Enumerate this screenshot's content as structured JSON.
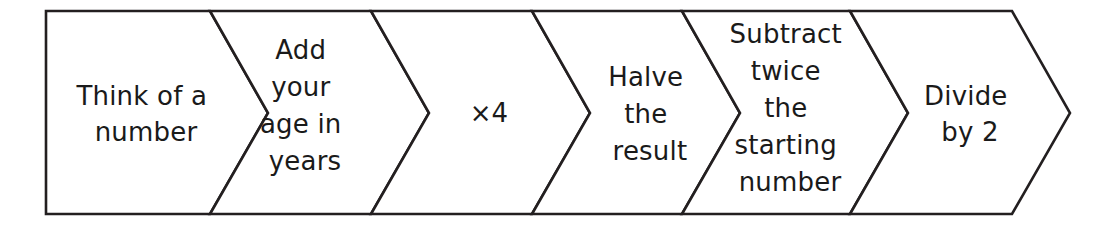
{
  "diagram": {
    "type": "chevron-process-flow",
    "orientation": "left-to-right",
    "background_color": "#ffffff",
    "stroke_color": "#231f20",
    "fill_color": "#ffffff",
    "text_color": "#1a1a1a",
    "step_count": 6,
    "steps": [
      {
        "index": 1,
        "name": "think-of-a-number",
        "text": "Think of a number",
        "lines": [
          "Think of a",
          "number"
        ]
      },
      {
        "index": 2,
        "name": "add-your-age-in-years",
        "text": "Add your age in years",
        "lines": [
          "Add",
          "your",
          "age in",
          "years"
        ]
      },
      {
        "index": 3,
        "name": "multiply-by-four",
        "text": "×4",
        "lines": [
          "×4"
        ]
      },
      {
        "index": 4,
        "name": "halve-the-result",
        "text": "Halve the result",
        "lines": [
          "Halve",
          "the",
          "result"
        ]
      },
      {
        "index": 5,
        "name": "subtract-twice-the-starting-number",
        "text": "Subtract twice the starting number",
        "lines": [
          "Subtract",
          "twice",
          "the",
          "starting",
          "number"
        ]
      },
      {
        "index": 6,
        "name": "divide-by-two",
        "text": "Divide by 2",
        "lines": [
          "Divide",
          "by 2"
        ]
      }
    ]
  }
}
